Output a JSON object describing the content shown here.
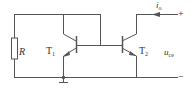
{
  "diagram": {
    "type": "current-mirror-circuit",
    "colors": {
      "wire": "#555555",
      "text": "#333333",
      "background": "#ffffff"
    },
    "components": {
      "resistor": {
        "label": "R"
      },
      "transistor_1": {
        "label": "T",
        "sub": "1"
      },
      "transistor_2": {
        "label": "T",
        "sub": "2"
      }
    },
    "output": {
      "current_label": "i",
      "current_sub": "o",
      "voltage_label": "u",
      "voltage_sub": "ce",
      "plus_terminal": "+",
      "minus_terminal": "−"
    }
  }
}
